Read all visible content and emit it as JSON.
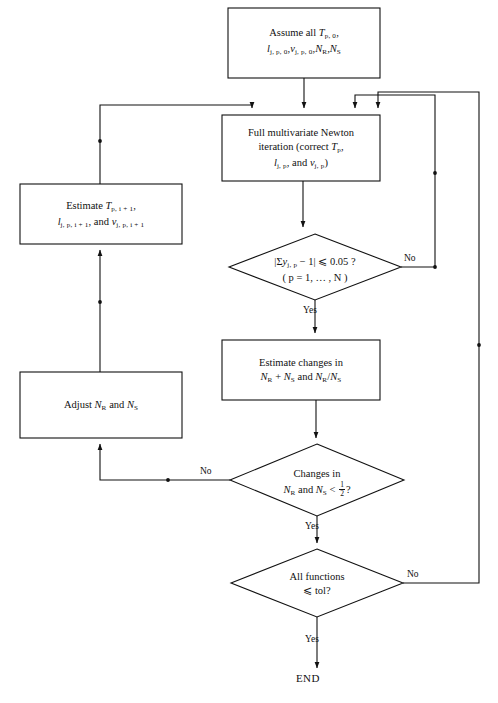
{
  "diagram": {
    "type": "flowchart",
    "stroke_color": "#111111",
    "fill_color": "#ffffff",
    "background": "#ffffff"
  },
  "nodes": {
    "start": {
      "shape": "process",
      "line1_prefix": "Assume all ",
      "sym_T": "T",
      "sub_T": "p, 0",
      "comma1": ",",
      "sym_l": "l",
      "sub_l": "j, p, 0",
      "comma2": ",",
      "sym_v": "v",
      "sub_v": "j, p, 0",
      "comma3": ",",
      "sym_NR": "N",
      "sub_NR": "R",
      "comma4": ",",
      "sym_NS": "N",
      "sub_NS": "S",
      "plain_text": "Assume all T(p,0), l(j,p,0), v(j,p,0), N(R), N(S)"
    },
    "newton": {
      "shape": "process",
      "line1": "Full multivariate Newton",
      "line2_prefix": "iteration (correct ",
      "sym_T": "T",
      "sub_T": "p",
      "comma": ",",
      "sym_l": "l",
      "sub_l": "j, p",
      "and_text": ", and ",
      "sym_v": "v",
      "sub_v": "j, p",
      "close": ")",
      "plain_text": "Full multivariate Newton iteration (correct T(p), l(j,p), and v(j,p))"
    },
    "estimate_tlv": {
      "shape": "process",
      "line1_prefix": "Estimate ",
      "sym_T": "T",
      "sub_T": "p, i + 1",
      "comma1": ",",
      "sym_l": "l",
      "sub_l": "j, p, i + 1",
      "and_text": ", and ",
      "sym_v": "v",
      "sub_v": "j, p, i + 1",
      "plain_text": "Estimate T(p,i+1), l(j,p,i+1), and v(j,p,i+1)"
    },
    "check_y": {
      "shape": "decision",
      "bar_open": "|",
      "sigma": "Σ",
      "sym_y": "y",
      "sub_y": "j, p",
      "minus_one": " − 1",
      "bar_close": "|",
      "op": " ⩽ 0.05 ?",
      "line2": "( p = 1, … , N )",
      "plain_text": "|Σy(j,p) − 1| ⩽ 0.05 ?  (p = 1, ..., N)"
    },
    "estimate_changes": {
      "shape": "process",
      "line1": "Estimate changes in",
      "sym_NR1": "N",
      "sub_NR1": "R",
      "plus": " + ",
      "sym_NS1": "N",
      "sub_NS1": "S",
      "and_text": " and ",
      "sym_NR2": "N",
      "sub_NR2": "R",
      "slash": "/",
      "sym_NS2": "N",
      "sub_NS2": "S",
      "plain_text": "Estimate changes in N(R) + N(S) and N(R)/N(S)"
    },
    "adjust": {
      "shape": "process",
      "prefix": "Adjust ",
      "sym_NR": "N",
      "sub_NR": "R",
      "and_text": " and ",
      "sym_NS": "N",
      "sub_NS": "S",
      "plain_text": "Adjust N(R) and N(S)"
    },
    "check_changes": {
      "shape": "decision",
      "line1": "Changes in",
      "sym_NR": "N",
      "sub_NR": "R",
      "and_text": " and ",
      "sym_NS": "N",
      "sub_NS": "S",
      "op": " < ",
      "frac_num": "1",
      "frac_den": "2",
      "question": "?",
      "plain_text": "Changes in N(R) and N(S) < 1/2 ?"
    },
    "check_tol": {
      "shape": "decision",
      "line1": "All functions",
      "line2": "⩽ tol?",
      "plain_text": "All functions ⩽ tol?"
    },
    "end": {
      "shape": "terminator",
      "label": "END"
    }
  },
  "edge_labels": {
    "check_y_no": "No",
    "check_y_yes": "Yes",
    "check_changes_no": "No",
    "check_changes_yes": "Yes",
    "check_tol_no": "No",
    "check_tol_yes": "Yes"
  }
}
